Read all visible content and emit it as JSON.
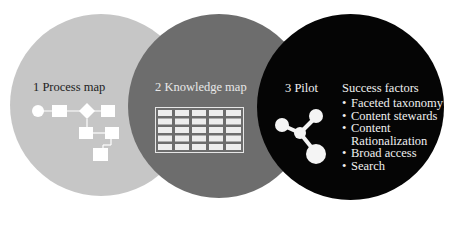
{
  "diagram": {
    "type": "three-overlapping-circles",
    "colors": {
      "circle1": "#c6c6c6",
      "circle2": "#6d6d6d",
      "circle3": "#050505",
      "icon_fill": "#ffffff"
    },
    "steps": [
      {
        "number": "1",
        "label": "1 Process map",
        "icon": "flowchart-icon"
      },
      {
        "number": "2",
        "label": "2 Knowledge map",
        "icon": "table-grid-icon"
      },
      {
        "number": "3",
        "label": "3 Pilot",
        "icon": "molecule-network-icon"
      }
    ],
    "success_factors": {
      "title": "Success factors",
      "items": [
        "Faceted taxonomy",
        "Content stewards",
        "Content Rationalization",
        "Broad access",
        "Search"
      ]
    }
  }
}
